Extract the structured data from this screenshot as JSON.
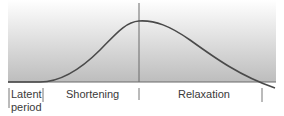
{
  "diagram": {
    "phases": [
      {
        "label_line1": "Latent",
        "label_line2": "period"
      },
      {
        "label": "Shortening"
      },
      {
        "label": "Relaxation"
      }
    ],
    "colors": {
      "curve": "#4a4a4a",
      "gradient_top": "#ffffff",
      "gradient_bottom": "#bdbdbd",
      "baseline": "#6a6a6a",
      "text": "#3a3a3a"
    }
  }
}
